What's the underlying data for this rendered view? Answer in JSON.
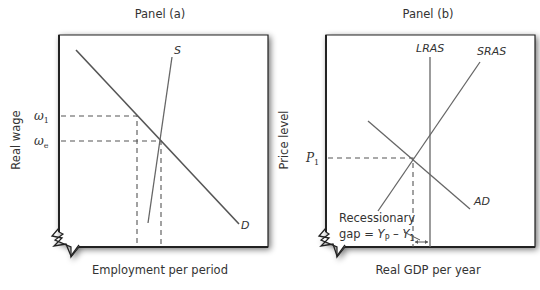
{
  "panel_a": {
    "title": "Panel (a)",
    "x_axis_label": "Employment per period",
    "y_axis_label": "Real wage",
    "ticks": {
      "omega_1": {
        "base": "ω",
        "sub": "1"
      },
      "omega_e": {
        "base": "ω",
        "sub": "e"
      }
    },
    "curves": {
      "supply": "S",
      "demand": "D"
    }
  },
  "panel_b": {
    "title": "Panel (b)",
    "x_axis_label": "Real GDP per year",
    "y_axis_label": "Price level",
    "ticks": {
      "p1": {
        "base": "P",
        "sub": "1"
      }
    },
    "curves": {
      "lras": "LRAS",
      "sras": "SRAS",
      "ad": "AD"
    },
    "annotation": {
      "line1": "Recessionary",
      "line2_prefix": "gap = ",
      "yp_base": "Y",
      "yp_sub": "P",
      "minus": " – ",
      "y1_base": "Y",
      "y1_sub": "1"
    }
  },
  "colors": {
    "line": "#555555",
    "frame": "#222222",
    "text": "#333333",
    "background": "#ffffff"
  }
}
